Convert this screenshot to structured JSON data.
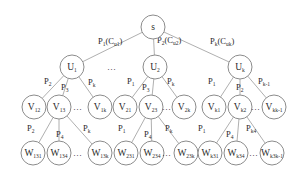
{
  "nodes": [
    {
      "id": "s",
      "base": "s",
      "sub": ""
    },
    {
      "id": "U1",
      "base": "U",
      "sub": "1"
    },
    {
      "id": "U2",
      "base": "U",
      "sub": "2"
    },
    {
      "id": "Uk",
      "base": "U",
      "sub": "k"
    },
    {
      "id": "V12",
      "base": "V",
      "sub": "12"
    },
    {
      "id": "V13",
      "base": "V",
      "sub": "13"
    },
    {
      "id": "V1k",
      "base": "V",
      "sub": "1k"
    },
    {
      "id": "V21",
      "base": "V",
      "sub": "21"
    },
    {
      "id": "V23",
      "base": "V",
      "sub": "23"
    },
    {
      "id": "V2k",
      "base": "V",
      "sub": "2k"
    },
    {
      "id": "Vk1",
      "base": "V",
      "sub": "k1"
    },
    {
      "id": "Vk2",
      "base": "V",
      "sub": "k2"
    },
    {
      "id": "Vkk-1",
      "base": "V",
      "sub": "kk-1"
    },
    {
      "id": "W131",
      "base": "W",
      "sub": "131"
    },
    {
      "id": "W134",
      "base": "W",
      "sub": "134"
    },
    {
      "id": "W13k",
      "base": "W",
      "sub": "13k"
    },
    {
      "id": "W231",
      "base": "W",
      "sub": "231"
    },
    {
      "id": "W234",
      "base": "W",
      "sub": "234"
    },
    {
      "id": "W23k",
      "base": "W",
      "sub": "23k"
    },
    {
      "id": "Wk31",
      "base": "W",
      "sub": "k31"
    },
    {
      "id": "Wk34",
      "base": "W",
      "sub": "k34"
    },
    {
      "id": "Wk3k-1",
      "base": "W",
      "sub": "k3k-1"
    }
  ],
  "edges": [
    {
      "from": "s",
      "to": "U1",
      "base": "P",
      "sub": "1",
      "extra": "(C",
      "extra_sub": "u1",
      "close": ")"
    },
    {
      "from": "s",
      "to": "U2",
      "base": "P",
      "sub": "2",
      "extra": "(C",
      "extra_sub": "u2",
      "close": ")"
    },
    {
      "from": "s",
      "to": "Uk",
      "base": "P",
      "sub": "k",
      "extra": "(C",
      "extra_sub": "uk",
      "close": ")"
    },
    {
      "from": "U1",
      "to": "V12",
      "base": "P",
      "sub": "2"
    },
    {
      "from": "U1",
      "to": "V13",
      "base": "P",
      "sub": "3"
    },
    {
      "from": "U1",
      "to": "V1k",
      "base": "P",
      "sub": "k"
    },
    {
      "from": "U2",
      "to": "V21",
      "base": "P",
      "sub": "1"
    },
    {
      "from": "U2",
      "to": "V23",
      "base": "P",
      "sub": "3"
    },
    {
      "from": "U2",
      "to": "V2k",
      "base": "P",
      "sub": "k"
    },
    {
      "from": "Uk",
      "to": "Vk1",
      "base": "P",
      "sub": "1"
    },
    {
      "from": "Uk",
      "to": "Vk2",
      "base": "P",
      "sub": "2"
    },
    {
      "from": "Uk",
      "to": "Vkk-1",
      "base": "P",
      "sub": "k-1"
    },
    {
      "from": "V13",
      "to": "W131",
      "base": "P",
      "sub": "2"
    },
    {
      "from": "V13",
      "to": "W134",
      "base": "P",
      "sub": "4"
    },
    {
      "from": "V13",
      "to": "W13k",
      "base": "P",
      "sub": "k"
    },
    {
      "from": "V23",
      "to": "W231",
      "base": "P",
      "sub": "1"
    },
    {
      "from": "V23",
      "to": "W234",
      "base": "P",
      "sub": "4"
    },
    {
      "from": "V23",
      "to": "W23k",
      "base": "P",
      "sub": "k"
    },
    {
      "from": "Vk2",
      "to": "Wk31",
      "base": "P",
      "sub": "1"
    },
    {
      "from": "Vk2",
      "to": "Wk34",
      "base": "P",
      "sub": "4"
    },
    {
      "from": "Vk2",
      "to": "Wk3k-1",
      "base": "P",
      "sub": "k4"
    }
  ],
  "ellipses": [
    "…",
    "…",
    "…",
    "…",
    "…",
    "…",
    "…"
  ]
}
